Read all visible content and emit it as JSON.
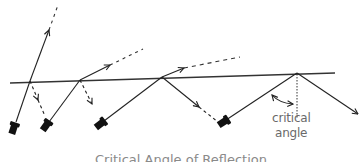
{
  "diagram": {
    "title": "Critical Angle of Reflection",
    "labels": {
      "critical_line1": "critical",
      "critical_line2": "angle"
    },
    "colors": {
      "line": "#222222",
      "surface": "#333333",
      "text": "#6a6a6a",
      "flashlight": "#111111"
    },
    "surface": {
      "x1": 10,
      "y1": 83,
      "x2": 335,
      "y2": 73
    },
    "beams": [
      {
        "name": "beam-1",
        "source": [
          14,
          127
        ],
        "hit": [
          30,
          81
        ],
        "refracted_end": [
          49,
          30
        ],
        "refracted_dash_end": [
          58,
          5
        ],
        "reflected_end": [
          45,
          108
        ],
        "reflected_dashed": true
      },
      {
        "name": "beam-2",
        "source": [
          48,
          125
        ],
        "hit": [
          80,
          80
        ],
        "refracted_end": [
          110,
          65
        ],
        "refracted_dash_end": [
          143,
          49
        ],
        "reflected_end": [
          92,
          110
        ],
        "reflected_dashed": true
      },
      {
        "name": "beam-3",
        "source": [
          101,
          124
        ],
        "hit": [
          162,
          77
        ],
        "refracted_end": [
          184,
          68
        ],
        "refracted_dash_end": [
          240,
          57
        ],
        "reflected_end": [
          200,
          108
        ],
        "reflected_dashed": false
      },
      {
        "name": "beam-4",
        "source": [
          222,
          122
        ],
        "hit": [
          297,
          73
        ],
        "reflected_end": [
          358,
          114
        ],
        "reflected_dashed": false
      }
    ]
  }
}
